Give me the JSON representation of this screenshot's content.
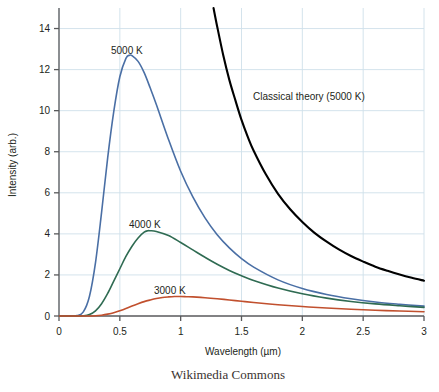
{
  "figure": {
    "caption": "Wikimedia Commons",
    "background_color": "#ffffff",
    "grid_color": "#cfe0ea",
    "axis_color": "#58595b",
    "text_color": "#231f20"
  },
  "axes": {
    "x_label": "Wavelength (µm)",
    "y_label": "Intensity (arb.)",
    "x_ticks": [
      "0",
      "0.5",
      "1",
      "1.5",
      "2",
      "2.5",
      "3"
    ],
    "y_ticks": [
      "0",
      "2",
      "4",
      "6",
      "8",
      "10",
      "12",
      "14"
    ]
  },
  "annotations": {
    "label_5000": "5000 K",
    "label_4000": "4000 K",
    "label_3000": "3000 K",
    "label_classical": "Classical theory (5000 K)"
  },
  "chart_data": {
    "type": "line",
    "title": "",
    "xlabel": "Wavelength (µm)",
    "ylabel": "Intensity (arb.)",
    "xlim": [
      0,
      3
    ],
    "ylim": [
      0,
      15
    ],
    "grid": true,
    "legend": "inline-annotations",
    "x_ticks": [
      0,
      0.5,
      1,
      1.5,
      2,
      2.5,
      3
    ],
    "y_ticks": [
      0,
      2,
      4,
      6,
      8,
      10,
      12,
      14
    ],
    "series": [
      {
        "name": "5000 K",
        "color": "#4a6fa5",
        "peak_x": 0.58,
        "peak_y": 12.7,
        "x": [
          0.1,
          0.15,
          0.2,
          0.25,
          0.3,
          0.35,
          0.4,
          0.45,
          0.5,
          0.55,
          0.58,
          0.6,
          0.65,
          0.7,
          0.75,
          0.8,
          0.9,
          1.0,
          1.1,
          1.2,
          1.3,
          1.4,
          1.5,
          1.6,
          1.8,
          2.0,
          2.2,
          2.4,
          2.6,
          2.8,
          3.0
        ],
        "y": [
          0.0,
          0.02,
          0.2,
          0.95,
          2.6,
          5.05,
          7.7,
          9.95,
          11.65,
          12.55,
          12.7,
          12.68,
          12.4,
          11.85,
          11.1,
          10.3,
          8.6,
          7.05,
          5.8,
          4.78,
          3.96,
          3.32,
          2.8,
          2.38,
          1.76,
          1.34,
          1.05,
          0.84,
          0.68,
          0.57,
          0.48
        ]
      },
      {
        "name": "4000 K",
        "color": "#2f6b52",
        "peak_x": 0.73,
        "peak_y": 4.15,
        "x": [
          0.15,
          0.2,
          0.25,
          0.3,
          0.35,
          0.4,
          0.45,
          0.5,
          0.55,
          0.6,
          0.65,
          0.7,
          0.73,
          0.75,
          0.8,
          0.9,
          1.0,
          1.1,
          1.2,
          1.3,
          1.4,
          1.5,
          1.6,
          1.8,
          2.0,
          2.2,
          2.4,
          2.6,
          2.8,
          3.0
        ],
        "y": [
          0.0,
          0.01,
          0.07,
          0.25,
          0.6,
          1.1,
          1.7,
          2.3,
          2.9,
          3.4,
          3.8,
          4.08,
          4.15,
          4.15,
          4.12,
          3.92,
          3.58,
          3.22,
          2.86,
          2.52,
          2.22,
          1.96,
          1.73,
          1.36,
          1.08,
          0.87,
          0.71,
          0.59,
          0.5,
          0.42
        ]
      },
      {
        "name": "3000 K",
        "color": "#c1502e",
        "peak_x": 0.98,
        "peak_y": 0.95,
        "x": [
          0.2,
          0.25,
          0.3,
          0.35,
          0.4,
          0.45,
          0.5,
          0.55,
          0.6,
          0.65,
          0.7,
          0.75,
          0.8,
          0.85,
          0.9,
          0.95,
          0.98,
          1.0,
          1.05,
          1.1,
          1.2,
          1.3,
          1.4,
          1.5,
          1.6,
          1.8,
          2.0,
          2.2,
          2.4,
          2.6,
          2.8,
          3.0
        ],
        "y": [
          0.0,
          0.0,
          0.01,
          0.04,
          0.09,
          0.16,
          0.26,
          0.37,
          0.49,
          0.6,
          0.7,
          0.78,
          0.85,
          0.9,
          0.93,
          0.95,
          0.95,
          0.95,
          0.94,
          0.93,
          0.89,
          0.84,
          0.78,
          0.72,
          0.66,
          0.55,
          0.46,
          0.39,
          0.33,
          0.28,
          0.24,
          0.21
        ]
      },
      {
        "name": "Classical theory (5000 K)",
        "color": "#000000",
        "x": [
          1.27,
          1.3,
          1.35,
          1.4,
          1.45,
          1.5,
          1.55,
          1.6,
          1.7,
          1.8,
          1.9,
          2.0,
          2.1,
          2.2,
          2.3,
          2.4,
          2.5,
          2.6,
          2.7,
          2.8,
          2.9,
          3.0
        ],
        "y": [
          15.0,
          14.1,
          12.7,
          11.5,
          10.5,
          9.55,
          8.75,
          8.05,
          6.9,
          5.95,
          5.2,
          4.58,
          4.05,
          3.62,
          3.24,
          2.92,
          2.65,
          2.4,
          2.2,
          2.02,
          1.86,
          1.72
        ]
      }
    ]
  }
}
